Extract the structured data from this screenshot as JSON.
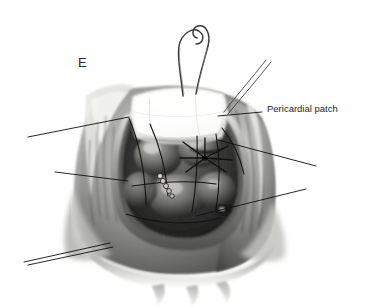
{
  "figure": {
    "panel_letter": "E",
    "background_color": "#ffffff",
    "rendering": "grayscale-pen-and-wash"
  },
  "labels": [
    {
      "id": "pericardial-patch",
      "text": "Pericardial patch",
      "color": "#1f1f1f",
      "leader_line": {
        "from_x": 262,
        "from_y": 111,
        "to_x": 218,
        "to_y": 116
      }
    }
  ],
  "leader_lines": [
    {
      "id": "leader-upper-left",
      "x1": 28,
      "x2": 129,
      "y1": 137,
      "y2": 117
    },
    {
      "id": "leader-mid-left",
      "x1": 55,
      "x2": 128,
      "y1": 172,
      "y2": 181
    },
    {
      "id": "leader-lower-left-a",
      "x1": 24,
      "x2": 110,
      "y1": 262,
      "y2": 243
    },
    {
      "id": "leader-lower-left-b",
      "x1": 28,
      "x2": 113,
      "y1": 265,
      "y2": 247
    },
    {
      "id": "leader-right-mid",
      "x1": 218,
      "x2": 316,
      "y1": 140,
      "y2": 166
    },
    {
      "id": "leader-lower-right",
      "x1": 196,
      "x2": 306,
      "y1": 216,
      "y2": 189
    }
  ],
  "anatomy": {
    "outer_tissue": "epicardial-ventricular-wall",
    "central_cavity": "ventricular-defect-opening",
    "patch": {
      "name": "pericardial-patch",
      "fill": "#fbfbfa",
      "description": "bright white quadrilateral graft sewn over superior defect margin"
    },
    "sutures": {
      "central_knot": "starburst-suture-knot",
      "pledget_row_count": 5,
      "needles_visible": 2,
      "free_threads_upper_right": 2
    }
  },
  "palette": {
    "background": "#ffffff",
    "tissue_dark": "#2e2e2e",
    "tissue_mid": "#7d7d7d",
    "tissue_light": "#c9c9c9",
    "highlight": "#f2f2f0",
    "patch_white": "#fbfbfa",
    "line_black": "#111111"
  }
}
